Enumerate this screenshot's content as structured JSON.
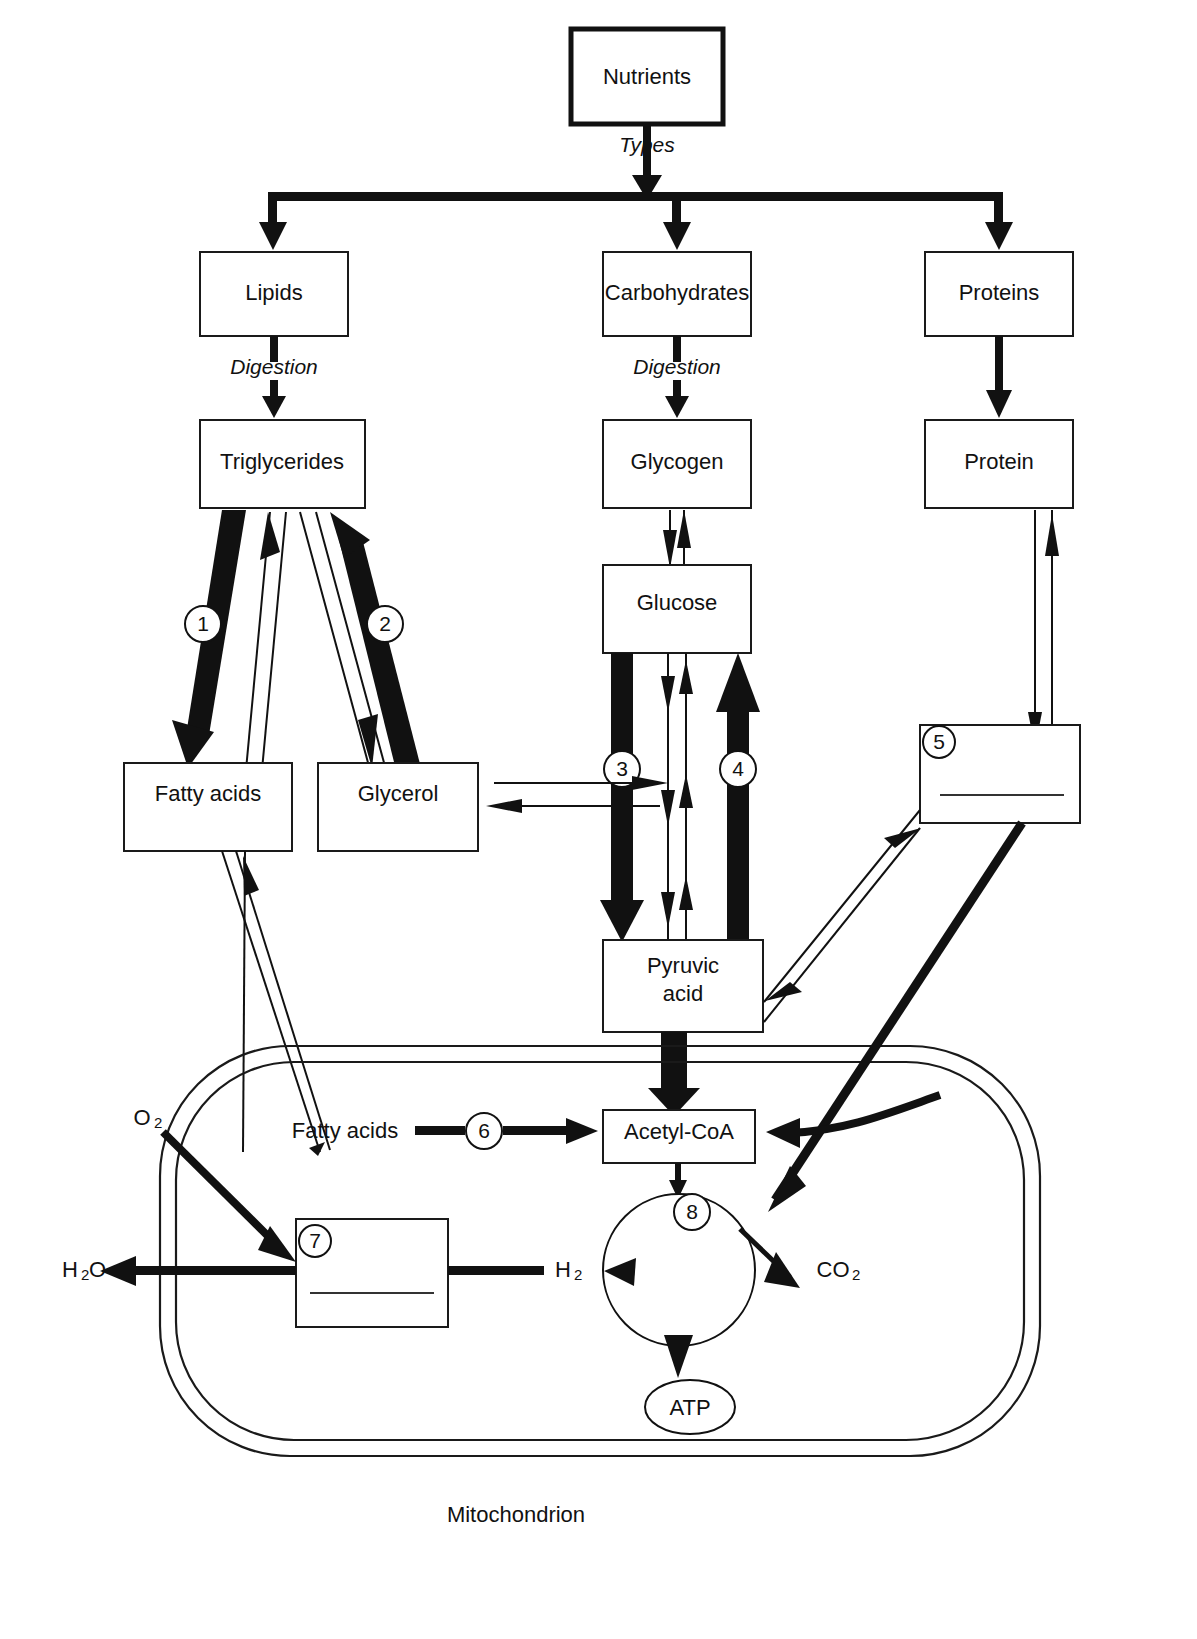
{
  "diagram": {
    "footer_label": "Mitochondrion"
  },
  "boxes": {
    "nutrients": "Nutrients",
    "lipids": "Lipids",
    "carbohydrates": "Carbohydrates",
    "proteins": "Proteins",
    "triglycerides": "Triglycerides",
    "glycogen": "Glycogen",
    "protein": "Protein",
    "fatty_acids": "Fatty acids",
    "glycerol": "Glycerol",
    "glucose": "Glucose",
    "pyruvic_acid_line1": "Pyruvic",
    "pyruvic_acid_line2": "acid",
    "acetyl_coa": "Acetyl-CoA",
    "mito_fatty_acids": "Fatty acids",
    "answer_box_5": "",
    "answer_box_7": ""
  },
  "edge_labels": {
    "types": "Types",
    "digestion_lipids": "Digestion",
    "digestion_carbs": "Digestion"
  },
  "molecules": {
    "o2": "O",
    "o2_sub": "2",
    "h2o": "H",
    "h2o_sub": "2",
    "h2o_tail": "O",
    "h2": "H",
    "h2_sub": "2",
    "co2": "CO",
    "co2_sub": "2",
    "atp": "ATP"
  },
  "numbered_steps": [
    {
      "id": "1",
      "label": "1",
      "meaning": "triglycerides-to-fatty-acids"
    },
    {
      "id": "2",
      "label": "2",
      "meaning": "glycerol-to-triglycerides"
    },
    {
      "id": "3",
      "label": "3",
      "meaning": "glucose-to-pyruvic-acid"
    },
    {
      "id": "4",
      "label": "4",
      "meaning": "pyruvic-acid-to-glucose"
    },
    {
      "id": "5",
      "label": "5",
      "meaning": "protein-breakdown-answer-box"
    },
    {
      "id": "6",
      "label": "6",
      "meaning": "fatty-acids-to-acetyl-coa"
    },
    {
      "id": "7",
      "label": "7",
      "meaning": "oxygen-water-answer-box"
    },
    {
      "id": "8",
      "label": "8",
      "meaning": "citric-acid-cycle"
    }
  ],
  "colors": {
    "ink": "#111111",
    "line": "#1a1a1a",
    "background": "#ffffff"
  }
}
